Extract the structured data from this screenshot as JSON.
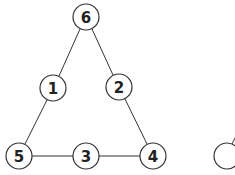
{
  "diagram": {
    "type": "graph",
    "colors": {
      "stroke": "#333333",
      "fill": "#ffffff",
      "text": "#222222"
    },
    "nodes": [
      {
        "id": "6",
        "label": "6",
        "x": 86,
        "y": 17
      },
      {
        "id": "1",
        "label": "1",
        "x": 53,
        "y": 88
      },
      {
        "id": "2",
        "label": "2",
        "x": 119,
        "y": 87
      },
      {
        "id": "5",
        "label": "5",
        "x": 19,
        "y": 156
      },
      {
        "id": "3",
        "label": "3",
        "x": 86,
        "y": 156
      },
      {
        "id": "4",
        "label": "4",
        "x": 153,
        "y": 156
      },
      {
        "id": "partial",
        "label": "",
        "x": 227,
        "y": 156
      }
    ],
    "edges": [
      [
        "6",
        "1"
      ],
      [
        "6",
        "2"
      ],
      [
        "1",
        "5"
      ],
      [
        "2",
        "4"
      ],
      [
        "5",
        "3"
      ],
      [
        "3",
        "4"
      ]
    ]
  }
}
